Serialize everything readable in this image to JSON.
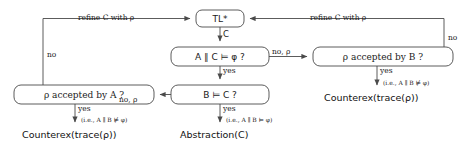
{
  "diagram": {
    "nodes": [
      {
        "id": "tl",
        "label": "TL*",
        "x": 196,
        "y": 10,
        "w": 48,
        "h": 17
      },
      {
        "id": "ac",
        "label": "A ∥ C ⊨ φ ?",
        "x": 171,
        "y": 47,
        "w": 98,
        "h": 19
      },
      {
        "id": "bc",
        "label": "B ⊨ C ?",
        "x": 171,
        "y": 85,
        "w": 98,
        "h": 19
      },
      {
        "id": "rb",
        "label": "ρ accepted by B ?",
        "x": 313,
        "y": 47,
        "w": 140,
        "h": 19
      },
      {
        "id": "ra",
        "label": "ρ accepted by A ?",
        "x": 14,
        "y": 85,
        "w": 140,
        "h": 19
      }
    ],
    "edge_labels": {
      "refine_left": "refine C with ρ",
      "refine_right": "refine C with ρ",
      "c": "C",
      "no_left": "no",
      "no_right": "no",
      "no_rho_right": "no, ρ",
      "no_rho_left": "no, ρ",
      "yes_ac": "yes",
      "yes_bc": "yes",
      "yes_rb": "yes",
      "yes_ra": "yes"
    },
    "terminals": [
      {
        "id": "counterex_left",
        "label": "Counterex(trace(ρ))",
        "note": "(i.e., A ∥ B ⊭ φ)"
      },
      {
        "id": "abstraction",
        "label": "Abstraction(C)",
        "note": "(i.e., A ∥ B ⊨ φ)"
      },
      {
        "id": "counterex_right",
        "label": "Counterex(trace(ρ))",
        "note": "(i.e., A ∥ B ⊭ φ)"
      }
    ],
    "colors": {
      "stroke": "#4a4a4a",
      "text": "#1a1a1a",
      "background": "#ffffff"
    }
  }
}
